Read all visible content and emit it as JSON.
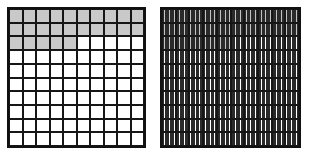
{
  "figure": {
    "background_color": "#ffffff",
    "line_color": "#161616",
    "shaded_color": "#c9c9c9",
    "unshaded_color": "#ffffff"
  },
  "grids": [
    {
      "name": "hundredths-grid",
      "label": "",
      "rows": 10,
      "columns": 10,
      "subdivisions_per_cell": 1,
      "total_parts": 100,
      "shaded_parts": 25,
      "shaded_cells_per_row": [
        10,
        10,
        5,
        0,
        0,
        0,
        0,
        0,
        0,
        0
      ]
    },
    {
      "name": "thousandths-grid",
      "label": "",
      "rows": 10,
      "columns": 10,
      "subdivisions_per_cell": 10,
      "total_parts": 1000,
      "shaded_parts": 250,
      "shaded_cells_per_row": [
        10,
        10,
        5,
        0,
        0,
        0,
        0,
        0,
        0,
        0
      ]
    }
  ],
  "chart_data": {
    "type": "heatmap",
    "title": "",
    "subtitle": "",
    "xlabel": "",
    "ylabel": "",
    "grid": true,
    "legend": "none",
    "panels": [
      {
        "name": "hundredths-grid",
        "rows": 10,
        "columns": 10,
        "cell_subdivisions": 1,
        "denominator": 100,
        "numerator": 25,
        "fraction": "25/100",
        "decimal": 0.25,
        "percent": 25,
        "values": [
          [
            1,
            1,
            1,
            1,
            1,
            1,
            1,
            1,
            1,
            1
          ],
          [
            1,
            1,
            1,
            1,
            1,
            1,
            1,
            1,
            1,
            1
          ],
          [
            1,
            1,
            1,
            1,
            1,
            0,
            0,
            0,
            0,
            0
          ],
          [
            0,
            0,
            0,
            0,
            0,
            0,
            0,
            0,
            0,
            0
          ],
          [
            0,
            0,
            0,
            0,
            0,
            0,
            0,
            0,
            0,
            0
          ],
          [
            0,
            0,
            0,
            0,
            0,
            0,
            0,
            0,
            0,
            0
          ],
          [
            0,
            0,
            0,
            0,
            0,
            0,
            0,
            0,
            0,
            0
          ],
          [
            0,
            0,
            0,
            0,
            0,
            0,
            0,
            0,
            0,
            0
          ],
          [
            0,
            0,
            0,
            0,
            0,
            0,
            0,
            0,
            0,
            0
          ],
          [
            0,
            0,
            0,
            0,
            0,
            0,
            0,
            0,
            0,
            0
          ]
        ]
      },
      {
        "name": "thousandths-grid",
        "rows": 10,
        "columns": 10,
        "cell_subdivisions": 10,
        "denominator": 1000,
        "numerator": 250,
        "fraction": "250/1000",
        "decimal": 0.25,
        "percent": 25,
        "values": [
          [
            1,
            1,
            1,
            1,
            1,
            1,
            1,
            1,
            1,
            1
          ],
          [
            1,
            1,
            1,
            1,
            1,
            1,
            1,
            1,
            1,
            1
          ],
          [
            1,
            1,
            1,
            1,
            1,
            0,
            0,
            0,
            0,
            0
          ],
          [
            0,
            0,
            0,
            0,
            0,
            0,
            0,
            0,
            0,
            0
          ],
          [
            0,
            0,
            0,
            0,
            0,
            0,
            0,
            0,
            0,
            0
          ],
          [
            0,
            0,
            0,
            0,
            0,
            0,
            0,
            0,
            0,
            0
          ],
          [
            0,
            0,
            0,
            0,
            0,
            0,
            0,
            0,
            0,
            0
          ],
          [
            0,
            0,
            0,
            0,
            0,
            0,
            0,
            0,
            0,
            0
          ],
          [
            0,
            0,
            0,
            0,
            0,
            0,
            0,
            0,
            0,
            0
          ],
          [
            0,
            0,
            0,
            0,
            0,
            0,
            0,
            0,
            0,
            0
          ]
        ]
      }
    ]
  }
}
